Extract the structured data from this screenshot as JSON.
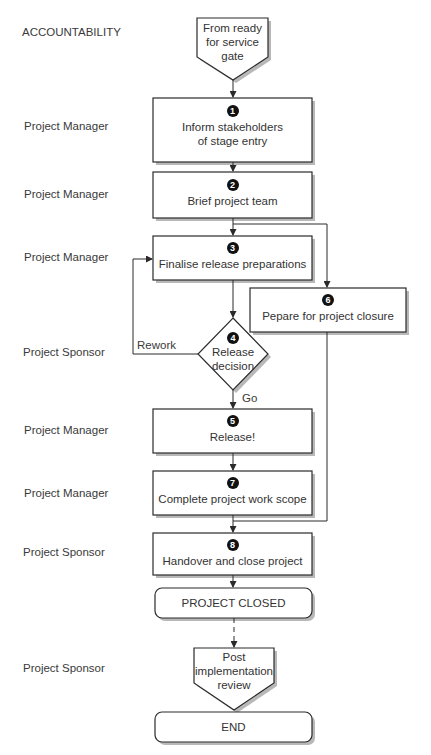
{
  "diagram": {
    "column_header": "ACCOUNTABILITY",
    "start": {
      "text_lines": [
        "From ready",
        "for service",
        "gate"
      ]
    },
    "steps": [
      {
        "number": "1",
        "text_lines": [
          "Inform stakeholders",
          "of stage entry"
        ],
        "accountability": "Project Manager"
      },
      {
        "number": "2",
        "text_lines": [
          "Brief project team"
        ],
        "accountability": "Project Manager"
      },
      {
        "number": "3",
        "text_lines": [
          "Finalise release preparations"
        ],
        "accountability": "Project Manager"
      },
      {
        "number": "4",
        "text_lines": [
          "Release",
          "decision"
        ],
        "accountability": "Project Sponsor",
        "type": "decision"
      },
      {
        "number": "5",
        "text_lines": [
          "Release!"
        ],
        "accountability": "Project Manager"
      },
      {
        "number": "6",
        "text_lines": [
          "Pepare for project closure"
        ],
        "accountability": ""
      },
      {
        "number": "7",
        "text_lines": [
          "Complete project work scope"
        ],
        "accountability": "Project Manager"
      },
      {
        "number": "8",
        "text_lines": [
          "Handover and close project"
        ],
        "accountability": "Project Sponsor"
      }
    ],
    "edge_labels": {
      "rework": "Rework",
      "go": "Go"
    },
    "closed": "PROJECT CLOSED",
    "post_review": {
      "text_lines": [
        "Post",
        "implementation",
        "review"
      ],
      "accountability": "Project Sponsor"
    },
    "end": "END",
    "colors": {
      "stroke": "#2a2a2a",
      "shadow": "#b5b5b5",
      "marker": "#111111"
    }
  }
}
